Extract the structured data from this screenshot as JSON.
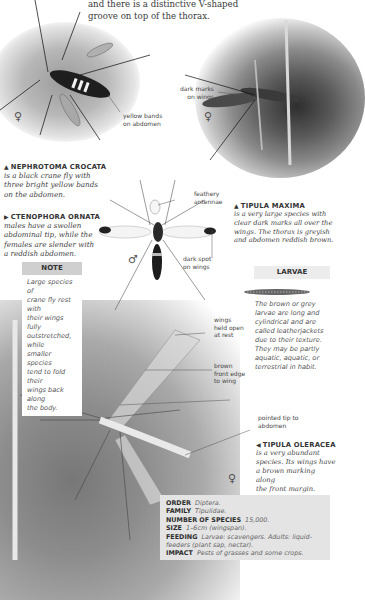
{
  "intro": {
    "cut_line": "(partially cut-off line of text)",
    "line1": "and there is a distinctive V-shaped",
    "line2": "groove on top of the thorax."
  },
  "photo1": {
    "labels": {
      "yellow_bands": [
        "yellow bands",
        "on abdomen"
      ]
    },
    "sex_symbol": "♀"
  },
  "photo2": {
    "labels": {
      "dark_marks": [
        "dark marks",
        "on wings"
      ]
    },
    "sex_symbol": "♀"
  },
  "photo_male": {
    "labels": {
      "feathery": [
        "feathery",
        "antennae"
      ],
      "dark_spot": [
        "dark spot",
        "on wings"
      ]
    },
    "sex_symbol": "♂"
  },
  "photo3": {
    "labels": {
      "wings_open": [
        "wings",
        "held open",
        "at rest"
      ],
      "brown_edge": [
        "brown",
        "front edge",
        "to wing"
      ],
      "pointed_tip": [
        "pointed tip to",
        "abdomen"
      ]
    },
    "sex_symbol": "♀"
  },
  "species": [
    {
      "pointer": "▲",
      "name": "NEPHROTOMA CROCATA",
      "desc": [
        "is a black crane fly with",
        "three bright yellow bands",
        "on the abdomen."
      ]
    },
    {
      "pointer": "▶",
      "name": "CTENOPHORA ORNATA",
      "desc": [
        "males have a swollen",
        "abdominal tip, while the",
        "females are slender with",
        "a reddish abdomen."
      ]
    },
    {
      "pointer": "▲",
      "name": "TIPULA MAXIMA",
      "desc": [
        "is a very large species with",
        "clear dark marks all over the",
        "wings. The thorax is greyish",
        "and abdomen reddish brown."
      ]
    },
    {
      "pointer": "◀",
      "name": "TIPULA OLERACEA",
      "desc": [
        "is a very abundant",
        "species. Its wings have",
        "a brown marking along",
        "the front margin."
      ]
    }
  ],
  "note": {
    "title": "NOTE",
    "lines": [
      "Large species of",
      "crane fly rest with",
      "their wings fully",
      "outstretched, while",
      "smaller species",
      "tend to fold their",
      "wings back along",
      "the body."
    ]
  },
  "larvae": {
    "title": "LARVAE",
    "lines": [
      "The brown or grey",
      "larvae are long and",
      "cylindrical and are",
      "called leatherjackets",
      "due to their texture.",
      "They may be partly",
      "aquatic, aquatic, or",
      "terrestrial in habit."
    ]
  },
  "facts": [
    {
      "label": "ORDER",
      "value": "Diptera."
    },
    {
      "label": "FAMILY",
      "value": "Tipulidae."
    },
    {
      "label": "NUMBER OF SPECIES",
      "value": "15,000."
    },
    {
      "label": "SIZE",
      "value": "1–6cm (wingspan)."
    },
    {
      "label": "FEEDING",
      "value": "Larvae: scavengers. Adults: liquid-feeders (plant sap, nectar)."
    },
    {
      "label": "IMPACT",
      "value": "Pests of grasses and some crops."
    }
  ]
}
